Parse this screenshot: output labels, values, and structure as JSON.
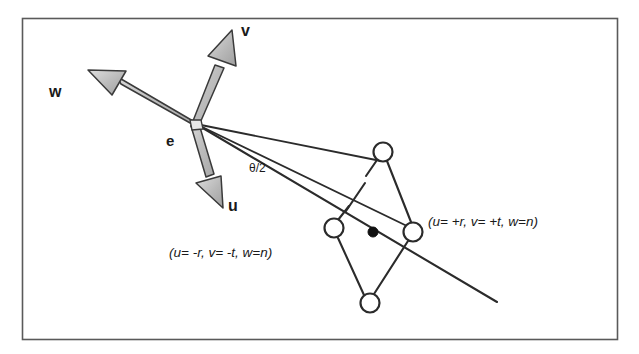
{
  "figure": {
    "background_color": "#ffffff",
    "frame": {
      "stroke": "#4a4a4a",
      "x": 22,
      "y": 18,
      "width": 596,
      "height": 322
    },
    "colors": {
      "line": "#2b2b2b",
      "arrow_fill": "#b4b4b4",
      "arrow_highlight": "#d8d8d8",
      "arrow_stroke": "#3a3a3a",
      "text": "#1a1a1a",
      "dot_fill": "#111111",
      "circle_fill": "#ffffff"
    },
    "origin": {
      "name": "e",
      "label": "e",
      "x": 196,
      "y": 124
    },
    "vectors": [
      {
        "name": "v",
        "label": "v",
        "tip_x": 232,
        "tip_y": 30,
        "label_x": 241,
        "label_y": 36
      },
      {
        "name": "w",
        "label": "w",
        "tip_x": 88,
        "tip_y": 70,
        "label_x": 49,
        "label_y": 97
      },
      {
        "name": "u",
        "label": "u",
        "tip_x": 223,
        "tip_y": 208,
        "label_x": 228,
        "label_y": 211
      }
    ],
    "angle": {
      "name": "theta-half",
      "label": "θ/2",
      "label_x": 249,
      "label_y": 172
    },
    "annotations": [
      {
        "name": "coord-label-negative",
        "text": "(u= -r, v= -t, w=n)",
        "x": 169,
        "y": 257
      },
      {
        "name": "coord-label-positive",
        "text": "(u= +r, v= +t, w=n)",
        "x": 428,
        "y": 226
      }
    ],
    "nodes": [
      {
        "name": "node-top",
        "x": 383,
        "y": 152,
        "r": 9.5,
        "filled": false
      },
      {
        "name": "node-right",
        "x": 413,
        "y": 232,
        "r": 9.5,
        "filled": false
      },
      {
        "name": "node-left",
        "x": 334,
        "y": 228,
        "r": 9.5,
        "filled": false
      },
      {
        "name": "node-bottom",
        "x": 370,
        "y": 303,
        "r": 9.5,
        "filled": false
      },
      {
        "name": "node-center",
        "x": 373,
        "y": 232,
        "r": 5.0,
        "filled": true
      }
    ]
  }
}
